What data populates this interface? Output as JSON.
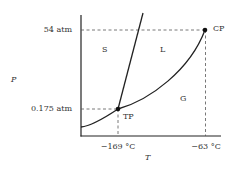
{
  "diagram": {
    "axes": {
      "x_label": "T",
      "y_label": "P"
    },
    "y_ticks": [
      {
        "label": "54 atm"
      },
      {
        "label": "0.175 atm"
      }
    ],
    "x_ticks": [
      {
        "label": "−169 °C"
      },
      {
        "label": "−63 °C"
      }
    ],
    "regions": {
      "solid": "S",
      "liquid": "L",
      "gas": "G"
    },
    "points": {
      "triple_point": {
        "label": "TP",
        "temperature": "−169 °C",
        "pressure": "0.175 atm"
      },
      "critical_point": {
        "label": "CP",
        "temperature": "−63 °C",
        "pressure": "54 atm"
      }
    },
    "colors": {
      "line": "#222222",
      "dashed": "#555555",
      "background": "#ffffff"
    }
  }
}
